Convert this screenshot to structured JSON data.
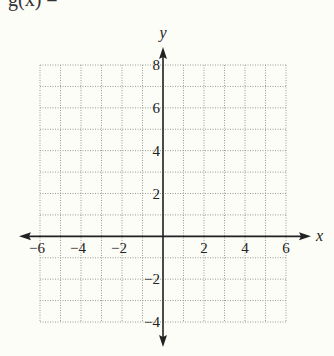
{
  "header": {
    "partial_label": "g(x) ="
  },
  "chart_data": {
    "type": "grid",
    "title": "",
    "xlabel": "x",
    "ylabel": "y",
    "xlim": [
      -6,
      6
    ],
    "ylim": [
      -4,
      8
    ],
    "grid": true,
    "grid_step": 1,
    "x_ticks": [
      -6,
      -4,
      -2,
      2,
      4,
      6
    ],
    "y_ticks": [
      8,
      6,
      4,
      2,
      -2,
      -4
    ],
    "series": []
  },
  "colors": {
    "background": "#fdfdf8",
    "axis": "#222222",
    "grid": "#9a9a9a",
    "text": "#222222"
  }
}
